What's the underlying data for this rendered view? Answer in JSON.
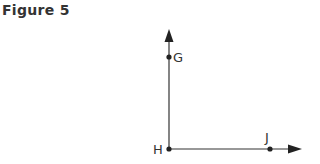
{
  "figure": {
    "title": "Figure 5",
    "points": {
      "G": "G",
      "H": "H",
      "J": "J"
    },
    "colors": {
      "line": "#333333",
      "text": "#333333"
    }
  }
}
